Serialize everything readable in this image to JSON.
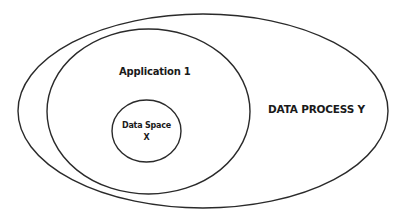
{
  "diagram": {
    "type": "nested-ellipses",
    "stroke_color": "#2a2a2a",
    "background": "#ffffff",
    "shapes": [
      {
        "id": "data-process-y",
        "label": "DATA PROCESS Y",
        "cx": 203,
        "cy": 111,
        "rx": 185,
        "ry": 97
      },
      {
        "id": "application-1",
        "label": "Application 1",
        "cx": 148.5,
        "cy": 111.5,
        "rx": 101.5,
        "ry": 82.5
      },
      {
        "id": "data-space-x",
        "label_line1": "Data Space",
        "label_line2": "X",
        "cx": 146.5,
        "cy": 131,
        "rx": 34.5,
        "ry": 31
      }
    ]
  }
}
